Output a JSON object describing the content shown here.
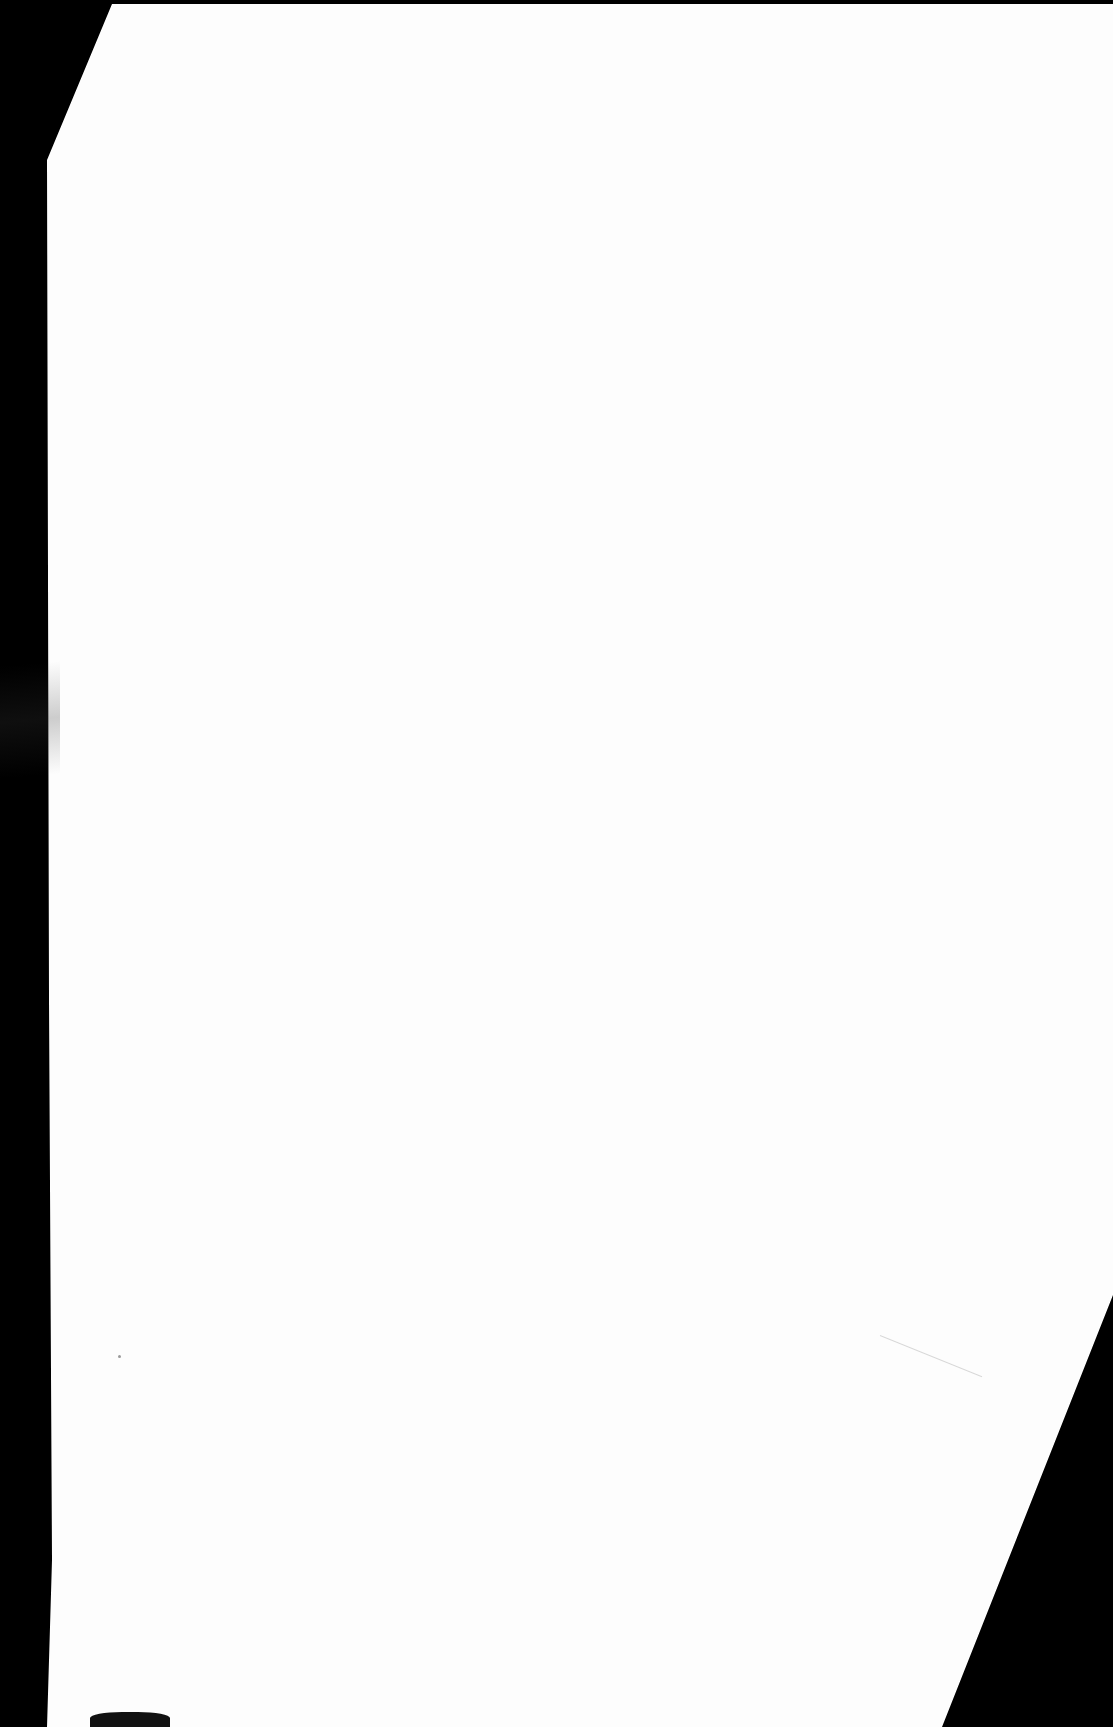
{
  "document": {
    "type": "scanned blank page",
    "text": "",
    "colors": {
      "background": "#000000",
      "page": "#fdfdfd"
    }
  }
}
